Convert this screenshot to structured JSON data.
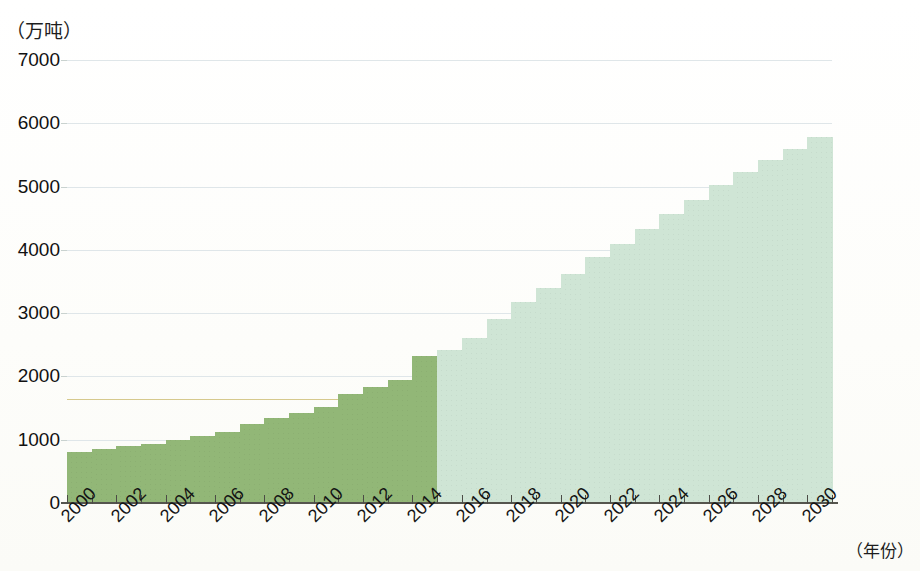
{
  "chart_data": {
    "type": "bar",
    "title": "",
    "subtitle": "",
    "xlabel": "（年份）",
    "ylabel": "（万吨）",
    "ylim": [
      0,
      7000
    ],
    "ytick_values": [
      0,
      1000,
      2000,
      3000,
      4000,
      5000,
      6000,
      7000
    ],
    "ytick_labels": [
      "0",
      "1000",
      "2000",
      "3000",
      "4000",
      "5000",
      "6000",
      "7000"
    ],
    "grid": true,
    "legend": "none",
    "x": [
      2000,
      2001,
      2002,
      2003,
      2004,
      2005,
      2006,
      2007,
      2008,
      2009,
      2010,
      2011,
      2012,
      2013,
      2014,
      2015,
      2016,
      2017,
      2018,
      2019,
      2020,
      2021,
      2022,
      2023,
      2024,
      2025,
      2026,
      2027,
      2028,
      2029,
      2030
    ],
    "xtick_labels": [
      "2000",
      "2002",
      "2004",
      "2006",
      "2008",
      "2010",
      "2012",
      "2014",
      "2016",
      "2018",
      "2020",
      "2022",
      "2024",
      "2026",
      "2028",
      "2030"
    ],
    "categories": [
      "2000",
      "2001",
      "2002",
      "2003",
      "2004",
      "2005",
      "2006",
      "2007",
      "2008",
      "2009",
      "2010",
      "2011",
      "2012",
      "2013",
      "2014",
      "2015",
      "2016",
      "2017",
      "2018",
      "2019",
      "2020",
      "2021",
      "2022",
      "2023",
      "2024",
      "2025",
      "2026",
      "2027",
      "2028",
      "2029",
      "2030"
    ],
    "values": [
      800,
      850,
      900,
      930,
      1000,
      1060,
      1130,
      1250,
      1350,
      1430,
      1520,
      1720,
      1830,
      1950,
      2320,
      2420,
      2600,
      2900,
      3180,
      3400,
      3620,
      3880,
      4100,
      4330,
      4560,
      4790,
      5020,
      5230,
      5420,
      5600,
      5790
    ],
    "series": [
      {
        "name": "历史",
        "kind": "historical",
        "color": "#92b777",
        "x": [
          2000,
          2001,
          2002,
          2003,
          2004,
          2005,
          2006,
          2007,
          2008,
          2009,
          2010,
          2011,
          2012,
          2013,
          2014
        ],
        "values": [
          800,
          850,
          900,
          930,
          1000,
          1060,
          1130,
          1250,
          1350,
          1430,
          1520,
          1720,
          1830,
          1950,
          2320
        ]
      },
      {
        "name": "预测",
        "kind": "forecast",
        "color": "#cfe5d5",
        "x": [
          2015,
          2016,
          2017,
          2018,
          2019,
          2020,
          2021,
          2022,
          2023,
          2024,
          2025,
          2026,
          2027,
          2028,
          2029,
          2030
        ],
        "values": [
          2420,
          2600,
          2900,
          3180,
          3400,
          3620,
          3880,
          4100,
          4330,
          4560,
          4790,
          5020,
          5230,
          5420,
          5600,
          5790
        ]
      }
    ],
    "annotations": [
      {
        "type": "hline",
        "value": 1650,
        "color": "#cfbf7a",
        "label": ""
      }
    ],
    "colors": {
      "historical_bar": "#92b777",
      "forecast_bar": "#cfe5d5",
      "gridline": "#dfe6e9",
      "axis": "#55554e",
      "annotation_rule": "#cfbf7a",
      "text": "#111111",
      "background": "#fdfdfb"
    }
  }
}
